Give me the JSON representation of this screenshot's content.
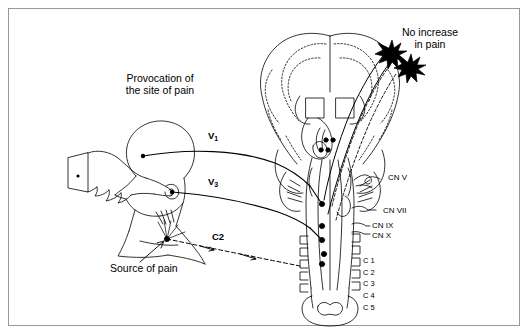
{
  "figure": {
    "domain": "anatomical-diagram",
    "background_color": "#ffffff",
    "border_color": "#999999",
    "ink_color": "#000000",
    "width": 530,
    "height": 336
  },
  "labels": {
    "title_line1": "Provocation of",
    "title_line2": "the site of pain",
    "note_line1": "No increase",
    "note_line2": "in pain",
    "source_of_pain": "Source of pain",
    "branch_v1": "V",
    "branch_v1_sub": "1",
    "branch_v3": "V",
    "branch_v3_sub": "3",
    "branch_c2": "C2"
  },
  "cranial_nerves": [
    {
      "name": "CN V",
      "x": 388,
      "y": 178
    },
    {
      "name": "CN VII",
      "x": 383,
      "y": 211
    },
    {
      "name": "CN IX",
      "x": 374,
      "y": 227
    },
    {
      "name": "CN X",
      "x": 374,
      "y": 236
    }
  ],
  "cervical_segments": [
    {
      "name": "C 1"
    },
    {
      "name": "C 2"
    },
    {
      "name": "C 3"
    },
    {
      "name": "C 4"
    },
    {
      "name": "C 5"
    }
  ],
  "icons": {
    "starburst_1": "starburst-icon",
    "starburst_2": "starburst-icon",
    "pointing_hand": "pointing-hand-icon",
    "head_profile": "head-profile-icon",
    "brain_coronal": "brain-coronal-icon",
    "brainstem": "brainstem-icon",
    "vertebra": "vertebra-icon"
  }
}
